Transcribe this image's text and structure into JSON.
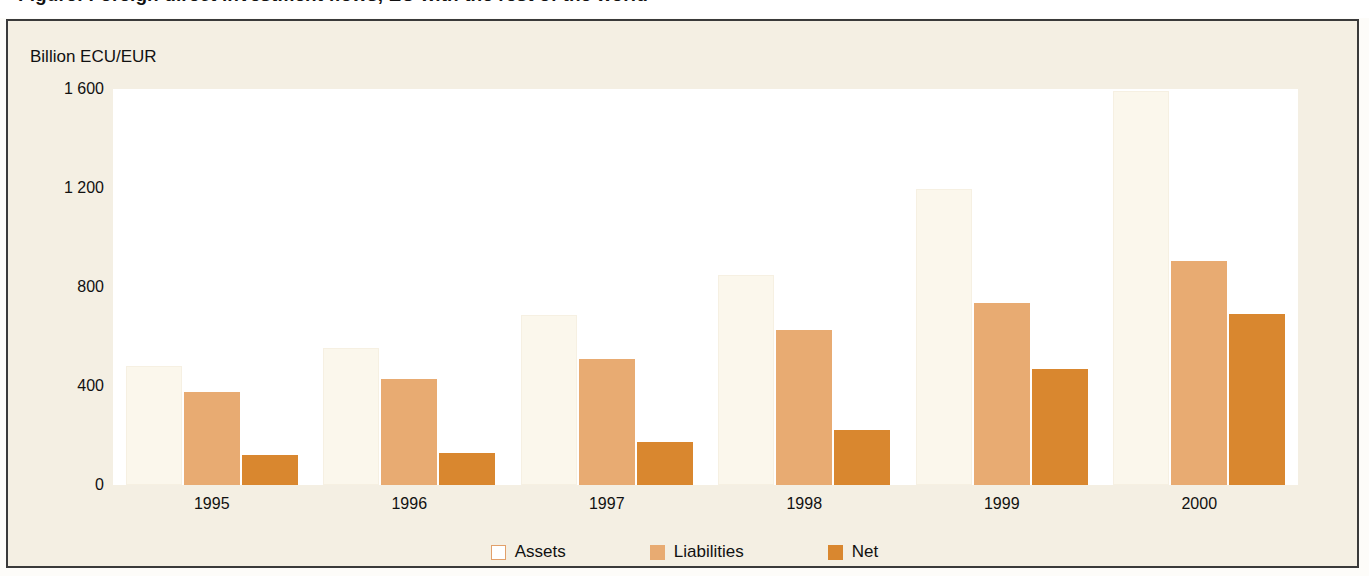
{
  "title": "Figure: Foreign direct investment flows, EU with the rest of the world",
  "axis_unit": "Billion ECU/EUR",
  "legend": [
    {
      "key": "assets",
      "label": "Assets",
      "color": "#ffffff",
      "border": "#e2a06a",
      "swatch_name": "legend-swatch-assets"
    },
    {
      "key": "liabilities",
      "label": "Liabilities",
      "color": "#e8ab72",
      "border": "#e8ab72",
      "swatch_name": "legend-swatch-liabilities"
    },
    {
      "key": "net",
      "label": "Net",
      "color": "#d9872f",
      "border": "#d9872f",
      "swatch_name": "legend-swatch-net"
    }
  ],
  "colors": {
    "panel_background": "#f4efe3",
    "panel_border": "#3a3a3a",
    "plot_background": "#ffffff",
    "assets": "#fbf7ec",
    "liabilities": "#e8ab72",
    "net": "#d9872f",
    "text": "#111111"
  },
  "chart_data": {
    "type": "bar",
    "title": "Figure: Foreign direct investment flows, EU with the rest of the world",
    "xlabel": "",
    "ylabel": "Billion ECU/EUR",
    "ylim": [
      0,
      1600
    ],
    "yticks": [
      0,
      400,
      800,
      1200,
      1600
    ],
    "ytick_labels": [
      "0",
      "400",
      "800",
      "1 200",
      "1 600"
    ],
    "grid": false,
    "legend_position": "bottom",
    "categories": [
      "1995",
      "1996",
      "1997",
      "1998",
      "1999",
      "2000"
    ],
    "series": [
      {
        "name": "Assets",
        "color": "#fbf7ec",
        "values": [
          480,
          555,
          685,
          850,
          1195,
          1590
        ]
      },
      {
        "name": "Liabilities",
        "color": "#e8ab72",
        "values": [
          375,
          430,
          510,
          625,
          735,
          905
        ]
      },
      {
        "name": "Net",
        "color": "#d9872f",
        "values": [
          120,
          128,
          175,
          222,
          470,
          690
        ]
      }
    ]
  }
}
